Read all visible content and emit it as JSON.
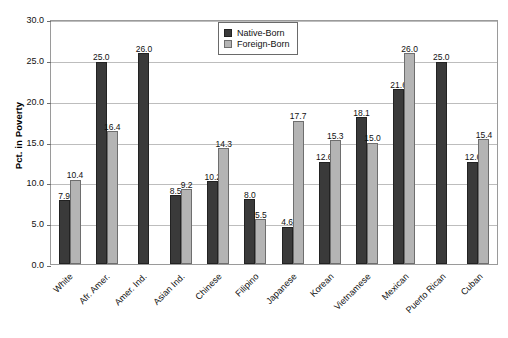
{
  "chart_data": {
    "type": "bar",
    "title": "",
    "xlabel": "",
    "ylabel": "Pct. in Poverty",
    "ylim": [
      0,
      30
    ],
    "ytick_step": 5,
    "yticks": [
      "0.0",
      "5.0",
      "10.0",
      "15.0",
      "20.0",
      "25.0",
      "30.0"
    ],
    "grid": true,
    "legend_position": "top-center",
    "categories": [
      "White",
      "Afr. Amer.",
      "Amer. Ind.",
      "Asian Ind.",
      "Chinese",
      "Filipino",
      "Japanese",
      "Korean",
      "Vietnamese",
      "Mexican",
      "Puerto Rican",
      "Cuban"
    ],
    "series": [
      {
        "name": "Native-Born",
        "color": "#3a3a3a",
        "values": [
          7.9,
          25.0,
          26.0,
          8.5,
          10.2,
          8.0,
          4.6,
          12.6,
          18.1,
          21.6,
          25.0,
          12.6
        ],
        "labels": [
          "7.9",
          "25.0",
          "26.0",
          "8.5",
          "10.2",
          "8.0",
          "4.6",
          "12.6",
          "18.1",
          "21.6",
          "25.0",
          "12.6"
        ]
      },
      {
        "name": "Foreign-Born",
        "color": "#b4b4b4",
        "values": [
          10.4,
          16.4,
          null,
          9.2,
          14.3,
          5.5,
          17.7,
          15.3,
          15.0,
          26.0,
          null,
          15.4
        ],
        "labels": [
          "10.4",
          "16.4",
          "",
          "9.2",
          "14.3",
          "5.5",
          "17.7",
          "15.3",
          "15.0",
          "26.0",
          "",
          "15.4"
        ]
      }
    ]
  },
  "legend": {
    "items": [
      {
        "label": "Native-Born"
      },
      {
        "label": "Foreign-Born"
      }
    ]
  },
  "caption": {
    "text": ""
  }
}
